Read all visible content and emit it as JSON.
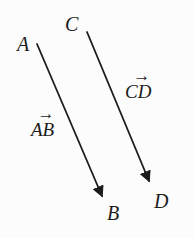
{
  "figure": {
    "type": "geometry-vector-diagram",
    "background_color": "#fcfcfc",
    "ink_color": "#1c1c1c",
    "vector_arrow_glyph": "→",
    "points": {
      "A": {
        "label": "A",
        "x": 37,
        "y": 44
      },
      "B": {
        "label": "B",
        "x": 105,
        "y": 202
      },
      "C": {
        "label": "C",
        "x": 87,
        "y": 32
      },
      "D": {
        "label": "D",
        "x": 152,
        "y": 187
      }
    },
    "vectors": [
      {
        "name": "AB",
        "label": "AB",
        "from": "A",
        "to": "B"
      },
      {
        "name": "CD",
        "label": "CD",
        "from": "C",
        "to": "D"
      }
    ]
  }
}
